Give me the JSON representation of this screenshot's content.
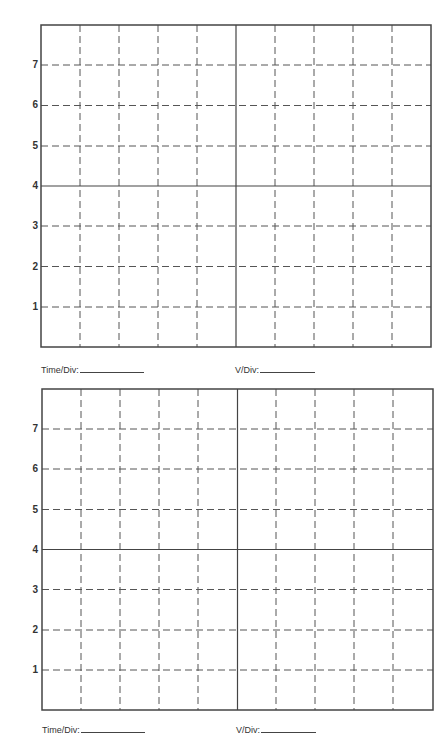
{
  "graticules": [
    {
      "id": "upper",
      "y_labels": [
        "7",
        "6",
        "5",
        "4",
        "3",
        "2",
        "1"
      ],
      "time_div_label": "Time/Div:",
      "v_div_label": "V/Div:",
      "time_div_value": "",
      "v_div_value": ""
    },
    {
      "id": "lower",
      "y_labels": [
        "7",
        "6",
        "5",
        "4",
        "3",
        "2",
        "1"
      ],
      "time_div_label": "Time/Div:",
      "v_div_label": "V/Div:",
      "time_div_value": "",
      "v_div_value": ""
    }
  ],
  "grid": {
    "columns": 10,
    "rows": 8,
    "line_color": "#555555",
    "border_color": "#444444"
  }
}
